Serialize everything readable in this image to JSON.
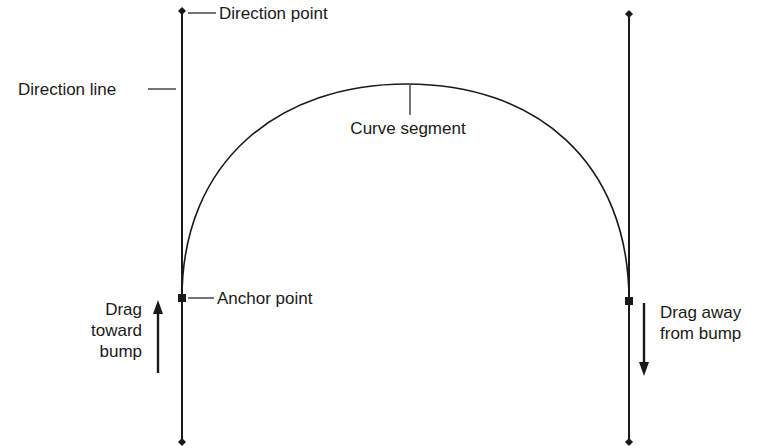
{
  "colors": {
    "stroke": "#1a1a1a",
    "background": "#ffffff"
  },
  "labels": {
    "direction_point": "Direction point",
    "direction_line": "Direction line",
    "curve_segment": "Curve segment",
    "anchor_point": "Anchor point",
    "drag_toward": [
      "Drag",
      "toward",
      "bump"
    ],
    "drag_away": [
      "Drag away",
      "from bump"
    ]
  },
  "elements": {
    "left_direction_line": {
      "x": 182,
      "y_top": 11,
      "y_bottom": 442
    },
    "right_direction_line": {
      "x": 629,
      "y_top": 14,
      "y_bottom": 442
    },
    "left_anchor": {
      "x": 182,
      "y": 298
    },
    "right_anchor": {
      "x": 629,
      "y": 301
    },
    "curve_apex": {
      "x": 407,
      "y": 84
    },
    "arrow_up": "up-arrow",
    "arrow_down": "down-arrow"
  }
}
